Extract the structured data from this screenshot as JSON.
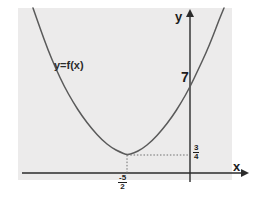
{
  "figure": {
    "panel_color": "#ecebeb",
    "background_color": "#ffffff",
    "curve_color": "#5a5a5a",
    "axis_color": "#2b2b2b",
    "guide_color": "#8a8a8a"
  },
  "axes": {
    "x_label": "x",
    "y_label": "y"
  },
  "annotations": {
    "function_label": "y=f(x)",
    "y_intercept_label": "7",
    "vertex_y_numerator": "3",
    "vertex_y_denominator": "4",
    "vertex_x_numerator": "-5",
    "vertex_x_denominator": "2"
  },
  "chart_data": {
    "type": "line",
    "xlabel": "x",
    "ylabel": "y",
    "grid": false,
    "legend": false,
    "curve_shape": "parabola-opening-upward",
    "vertex": {
      "x": -2.5,
      "y": 0.75,
      "x_label": "-5/2",
      "y_label": "3/4"
    },
    "y_intercept": {
      "x": 0,
      "y": 7,
      "label": "7"
    },
    "series": [
      {
        "name": "f(x)",
        "points_pixel": [
          [
            33,
            8
          ],
          [
            40,
            28
          ],
          [
            48,
            50
          ],
          [
            56,
            69
          ],
          [
            64,
            86
          ],
          [
            73,
            102
          ],
          [
            82,
            116
          ],
          [
            92,
            129
          ],
          [
            102,
            140
          ],
          [
            112,
            148
          ],
          [
            120,
            152
          ],
          [
            127,
            155
          ],
          [
            134,
            153
          ],
          [
            142,
            149
          ],
          [
            152,
            141
          ],
          [
            162,
            130
          ],
          [
            172,
            117
          ],
          [
            181,
            103
          ],
          [
            190,
            87
          ],
          [
            198,
            70
          ],
          [
            206,
            53
          ],
          [
            213,
            36
          ],
          [
            219,
            20
          ],
          [
            224,
            8
          ]
        ]
      }
    ],
    "guides": [
      {
        "type": "vertical-dotted",
        "from_pixel": [
          127,
          155
        ],
        "to_pixel": [
          127,
          173
        ]
      },
      {
        "type": "horizontal-dotted",
        "from_pixel": [
          127,
          155
        ],
        "to_pixel": [
          190,
          155
        ]
      }
    ],
    "axis_pixel_geometry": {
      "x_axis_y": 173,
      "y_axis_x": 190,
      "x_axis_from": 22,
      "x_axis_to": 246,
      "y_axis_from": 182,
      "y_axis_to": 12
    }
  }
}
